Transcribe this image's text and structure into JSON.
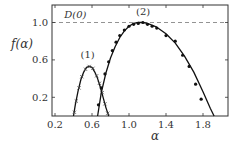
{
  "chart_data": {
    "type": "line",
    "title": "",
    "xlabel": "α",
    "ylabel": "f(α)",
    "xlim": [
      0.2,
      2.07
    ],
    "ylim": [
      0.0,
      1.19
    ],
    "xticks": [
      0.2,
      0.6,
      1.0,
      1.4,
      1.8
    ],
    "xtick_labels": [
      "0.2",
      "0.6",
      "1.0",
      "1.4",
      "1.8"
    ],
    "yticks": [
      0.2,
      0.6,
      1.0
    ],
    "ytick_labels": [
      "0.2",
      "0.6",
      "1.0"
    ],
    "grid": false,
    "legend": null,
    "annotations": [
      {
        "text": "D(0)",
        "x": 0.3,
        "y": 1.05
      },
      {
        "text": "(1)",
        "x": 0.52,
        "y": 0.6
      },
      {
        "text": "(2)",
        "x": 1.12,
        "y": 1.06
      }
    ],
    "reference_lines": [
      {
        "type": "horizontal",
        "y": 1.0,
        "style": "dashed",
        "label": "D(0)"
      }
    ],
    "series": [
      {
        "name": "(1) fit",
        "style": "solid line",
        "x": [
          0.4,
          0.42,
          0.45,
          0.48,
          0.51,
          0.54,
          0.57,
          0.6,
          0.63,
          0.66,
          0.69,
          0.72,
          0.75,
          0.78
        ],
        "y": [
          0.0,
          0.12,
          0.27,
          0.39,
          0.47,
          0.52,
          0.53,
          0.52,
          0.47,
          0.4,
          0.31,
          0.2,
          0.09,
          0.0
        ]
      },
      {
        "name": "(1) data",
        "style": "x markers",
        "x": [
          0.41,
          0.43,
          0.46,
          0.49,
          0.53,
          0.57,
          0.61,
          0.65,
          0.68,
          0.71,
          0.74,
          0.77
        ],
        "y": [
          0.04,
          0.16,
          0.3,
          0.42,
          0.5,
          0.53,
          0.51,
          0.43,
          0.35,
          0.25,
          0.13,
          0.03
        ]
      },
      {
        "name": "(2) fit",
        "style": "solid line",
        "x": [
          0.66,
          0.7,
          0.75,
          0.8,
          0.85,
          0.9,
          0.95,
          1.0,
          1.05,
          1.1,
          1.15,
          1.2,
          1.3,
          1.4,
          1.5,
          1.6,
          1.7,
          1.8,
          1.88,
          1.92
        ],
        "y": [
          0.0,
          0.25,
          0.46,
          0.62,
          0.74,
          0.84,
          0.91,
          0.96,
          0.99,
          1.0,
          1.0,
          0.99,
          0.95,
          0.88,
          0.78,
          0.64,
          0.47,
          0.26,
          0.08,
          0.0
        ]
      },
      {
        "name": "(2) data",
        "style": "filled circle markers",
        "x": [
          0.67,
          0.7,
          0.74,
          0.78,
          0.82,
          0.86,
          0.9,
          0.95,
          1.0,
          1.05,
          1.1,
          1.15,
          1.2,
          1.25,
          1.3,
          1.4,
          1.5,
          1.58,
          1.65,
          1.72,
          1.78
        ],
        "y": [
          0.12,
          0.3,
          0.45,
          0.58,
          0.7,
          0.79,
          0.86,
          0.92,
          0.96,
          0.98,
          0.99,
          1.0,
          0.98,
          0.96,
          0.94,
          0.86,
          0.8,
          0.65,
          0.53,
          0.34,
          0.18
        ]
      }
    ]
  }
}
